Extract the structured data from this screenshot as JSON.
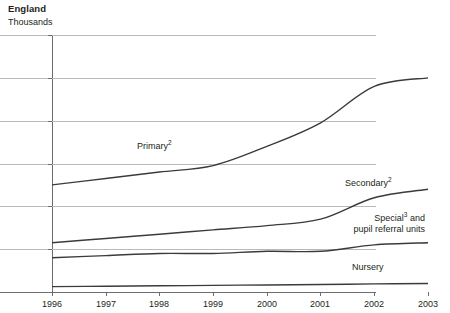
{
  "header": {
    "title": "England",
    "unit_label": "Thousands"
  },
  "chart_data": {
    "type": "line",
    "title": "England",
    "subtitle": "Thousands",
    "xlabel": "",
    "ylabel": "Thousands",
    "xlim": [
      1996,
      2003
    ],
    "ylim": [
      0,
      120
    ],
    "grid": true,
    "legend_position": "inline-labels",
    "x": [
      1996,
      1997,
      1998,
      1999,
      2000,
      2001,
      2002,
      2003
    ],
    "xticks": [
      "1996",
      "1997",
      "1998",
      "1999",
      "2000",
      "2001",
      "2002",
      "2003"
    ],
    "yticks": [
      "0",
      "20",
      "40",
      "60",
      "80",
      "100",
      "120"
    ],
    "series": [
      {
        "name": "Primary",
        "label": "Primary",
        "footnote": "2",
        "color": "#3b3b3b",
        "values": [
          50,
          53,
          56,
          59,
          68,
          79,
          96,
          100
        ]
      },
      {
        "name": "Secondary",
        "label": "Secondary",
        "footnote": "2",
        "color": "#3b3b3b",
        "values": [
          23,
          25,
          27,
          29,
          31,
          34,
          44,
          48
        ]
      },
      {
        "name": "Special and pupil referral units",
        "label": "Special",
        "footnote": "3",
        "label_line2": "pupil referral units",
        "label_connector": "and",
        "color": "#3b3b3b",
        "values": [
          16,
          17,
          18,
          18,
          19,
          19,
          22,
          23
        ]
      },
      {
        "name": "Nursery",
        "label": "Nursery",
        "footnote": "",
        "color": "#3b3b3b",
        "values": [
          2.5,
          2.7,
          2.9,
          3.1,
          3.3,
          3.5,
          3.8,
          4.0
        ]
      }
    ]
  },
  "labels": {
    "primary": "Primary",
    "primary_sup": "2",
    "secondary": "Secondary",
    "secondary_sup": "2",
    "special": "Special",
    "special_sup": "3",
    "special_and": " and",
    "special_line2": "pupil referral units",
    "nursery": "Nursery"
  },
  "axes": {
    "y_ticks": [
      "120",
      "100",
      "80",
      "60",
      "40",
      "20",
      "0"
    ],
    "x_ticks": [
      "1996",
      "1997",
      "1998",
      "1999",
      "2000",
      "2001",
      "2002",
      "2003"
    ]
  }
}
